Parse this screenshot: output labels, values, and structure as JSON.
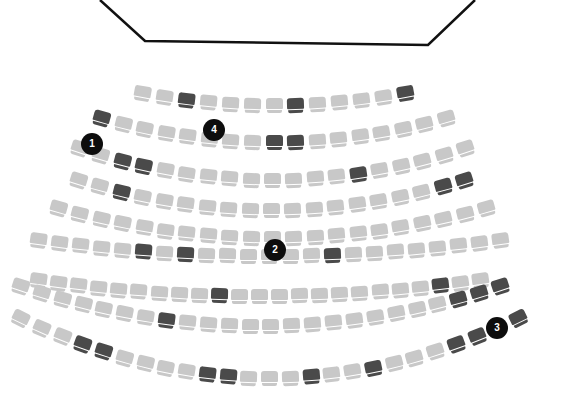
{
  "stage": {
    "label": "stage",
    "points": "100,0 145,41 428,45 475,0",
    "stroke": "#111111"
  },
  "colors": {
    "available": "#c8c8c8",
    "taken": "#4a4a4a",
    "badge": "#0d0d0d"
  },
  "rows": [
    {
      "row": 1,
      "count": 13,
      "x0": 142,
      "x1": 405,
      "yEnd": 93,
      "yMid": 105,
      "taken": [
        3,
        8,
        13
      ]
    },
    {
      "row": 2,
      "count": 17,
      "x0": 101,
      "x1": 446,
      "yEnd": 118,
      "yMid": 142,
      "taken": [
        1,
        9,
        10
      ]
    },
    {
      "row": 3,
      "count": 19,
      "x0": 79,
      "x1": 465,
      "yEnd": 148,
      "yMid": 180,
      "taken": [
        3,
        4,
        14
      ]
    },
    {
      "row": 4,
      "count": 19,
      "x0": 78,
      "x1": 464,
      "yEnd": 180,
      "yMid": 210,
      "taken": [
        3,
        18,
        19
      ]
    },
    {
      "row": 5,
      "count": 21,
      "x0": 58,
      "x1": 486,
      "yEnd": 208,
      "yMid": 238,
      "taken": []
    },
    {
      "row": 6,
      "count": 23,
      "x0": 38,
      "x1": 500,
      "yEnd": 240,
      "yMid": 256,
      "taken": [
        6,
        8,
        15
      ]
    },
    {
      "row": 7,
      "count": 23,
      "x0": 38,
      "x1": 480,
      "yEnd": 280,
      "yMid": 296,
      "taken": [
        10,
        21
      ]
    },
    {
      "row": 8,
      "count": 24,
      "x0": 20,
      "x1": 500,
      "yEnd": 286,
      "yMid": 326,
      "taken": [
        8,
        22,
        23,
        24
      ]
    },
    {
      "row": 9,
      "count": 25,
      "x0": 20,
      "x1": 518,
      "yEnd": 318,
      "yMid": 378,
      "taken": [
        4,
        5,
        10,
        11,
        15,
        18,
        22,
        23,
        25
      ]
    }
  ],
  "badges": [
    {
      "label": "1",
      "x": 81,
      "y": 133
    },
    {
      "label": "4",
      "x": 203,
      "y": 119
    },
    {
      "label": "2",
      "x": 264,
      "y": 239
    },
    {
      "label": "3",
      "x": 486,
      "y": 317
    }
  ]
}
